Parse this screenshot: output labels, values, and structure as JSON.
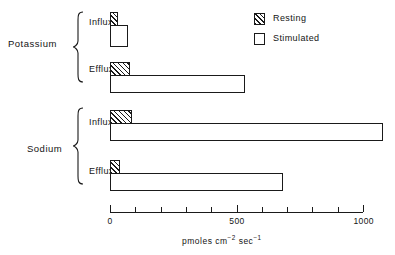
{
  "chart_data": {
    "type": "bar",
    "orientation": "horizontal",
    "title": "",
    "xlabel": "pmoles cm⁻² sec⁻¹",
    "xlabel_parts": {
      "prefix": "pmoles cm",
      "sup1": "−2",
      "mid": " sec",
      "sup2": "−1"
    },
    "ylabel": "",
    "xlim": [
      0,
      1000
    ],
    "xticks": [
      0,
      100,
      200,
      300,
      400,
      500,
      600,
      700,
      800,
      900,
      1000
    ],
    "xtick_labels": [
      "0",
      "",
      "",
      "",
      "",
      "500",
      "",
      "",
      "",
      "",
      "1000"
    ],
    "grid": false,
    "legend_position": "top-right",
    "groups": [
      {
        "name": "Potassium",
        "rows": [
          {
            "label": "Influx",
            "resting": 30,
            "stimulated": 70
          },
          {
            "label": "Efflux",
            "resting": 80,
            "stimulated": 533
          }
        ]
      },
      {
        "name": "Sodium",
        "rows": [
          {
            "label": "Influx",
            "resting": 85,
            "stimulated": 1080
          },
          {
            "label": "Efflux",
            "resting": 40,
            "stimulated": 685
          }
        ]
      }
    ],
    "series": [
      {
        "name": "Resting",
        "values": [
          30,
          80,
          85,
          40
        ],
        "fill": "hatched"
      },
      {
        "name": "Stimulated",
        "values": [
          70,
          533,
          1080,
          685
        ],
        "fill": "open"
      }
    ],
    "categories": [
      "Potassium Influx",
      "Potassium Efflux",
      "Sodium Influx",
      "Sodium Efflux"
    ]
  },
  "legend": {
    "items": [
      {
        "label": "Resting",
        "swatch": "hatched"
      },
      {
        "label": "Stimulated",
        "swatch": "open"
      }
    ]
  },
  "colors": {
    "ink": "#1a1a1a",
    "paper": "#ffffff"
  }
}
